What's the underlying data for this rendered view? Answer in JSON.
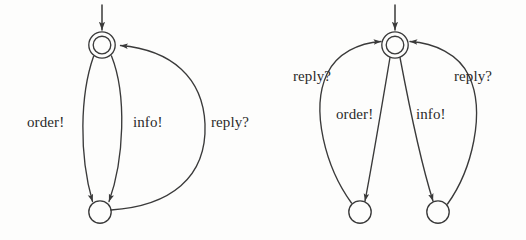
{
  "figure": {
    "kind": "state-transition-diagrams",
    "ink_color": "#3a3a3a",
    "background_color": "#fdfdfc",
    "machines": [
      {
        "id": "left-machine",
        "name": "single-state-loop-machine",
        "states": [
          {
            "id": "s0",
            "type": "initial-accepting",
            "shape": "double-circle",
            "cx": 102,
            "cy": 45,
            "r_outer": 13,
            "r_inner": 9
          },
          {
            "id": "s1",
            "type": "normal",
            "shape": "circle",
            "cx": 100,
            "cy": 212,
            "r_outer": 11
          }
        ],
        "start_arrow": {
          "from_x": 102,
          "from_y": 4,
          "to_x": 102,
          "to_y": 29
        },
        "transitions": [
          {
            "id": "l-order",
            "label": "order!",
            "from": "s0",
            "to": "s1",
            "bulge": "left"
          },
          {
            "id": "l-info",
            "label": "info!",
            "from": "s0",
            "to": "s1",
            "bulge": "right"
          },
          {
            "id": "l-reply",
            "label": "reply?",
            "from": "s1",
            "to": "s0",
            "bulge": "far-right"
          }
        ]
      },
      {
        "id": "right-machine",
        "name": "two-state-branch-machine",
        "states": [
          {
            "id": "t0",
            "type": "initial-accepting",
            "shape": "double-circle",
            "cx": 395,
            "cy": 45,
            "r_outer": 13,
            "r_inner": 9
          },
          {
            "id": "t1",
            "type": "normal",
            "shape": "circle",
            "cx": 360,
            "cy": 212,
            "r_outer": 11
          },
          {
            "id": "t2",
            "type": "normal",
            "shape": "circle",
            "cx": 438,
            "cy": 212,
            "r_outer": 11
          }
        ],
        "start_arrow": {
          "from_x": 395,
          "from_y": 4,
          "to_x": 395,
          "to_y": 29
        },
        "transitions": [
          {
            "id": "r-order",
            "label": "order!",
            "from": "t0",
            "to": "t1",
            "bulge": "slight-right"
          },
          {
            "id": "r-reply-left",
            "label": "reply?",
            "from": "t1",
            "to": "t0",
            "bulge": "left"
          },
          {
            "id": "r-info",
            "label": "info!",
            "from": "t0",
            "to": "t2",
            "bulge": "slight-left"
          },
          {
            "id": "r-reply-right",
            "label": "reply?",
            "from": "t2",
            "to": "t0",
            "bulge": "right"
          }
        ]
      }
    ],
    "labels": {
      "left": {
        "order": "order!",
        "info": "info!",
        "reply": "reply?"
      },
      "right": {
        "reply_left": "reply?",
        "reply_right": "reply?",
        "order": "order!",
        "info": "info!"
      }
    }
  }
}
